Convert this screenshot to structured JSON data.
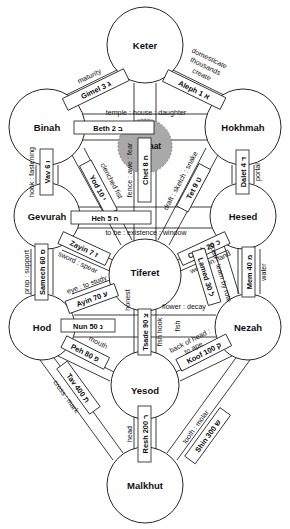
{
  "diagram": {
    "subtitle": "Sefirot and the 22 Hebrew letter paths",
    "colors": {
      "background": "#ffffff",
      "stroke": "#1a1a1a",
      "daat_fill": "#a9a9a9",
      "daat_stroke": "#6e6e6e",
      "text": "#111111"
    }
  },
  "sefirot": [
    {
      "id": "keter",
      "label": "Keter",
      "cx": 145,
      "cy": 45,
      "r": 38
    },
    {
      "id": "binah",
      "label": "Binah",
      "cx": 47,
      "cy": 127,
      "r": 38
    },
    {
      "id": "hokhmah",
      "label": "Hokhmah",
      "cx": 243,
      "cy": 127,
      "r": 38
    },
    {
      "id": "gevurah",
      "label": "Gevurah",
      "cx": 47,
      "cy": 216,
      "r": 33
    },
    {
      "id": "hesed",
      "label": "Hesed",
      "cx": 243,
      "cy": 216,
      "r": 33
    },
    {
      "id": "tiferet",
      "label": "Tiferet",
      "cx": 145,
      "cy": 275,
      "r": 36
    },
    {
      "id": "hod",
      "label": "Hod",
      "cx": 42,
      "cy": 327,
      "r": 33
    },
    {
      "id": "nezah",
      "label": "Nezah",
      "cx": 248,
      "cy": 327,
      "r": 33
    },
    {
      "id": "yesod",
      "label": "Yesod",
      "cx": 145,
      "cy": 385,
      "r": 34
    },
    {
      "id": "malkhut",
      "label": "Malkhut",
      "cx": 145,
      "cy": 485,
      "r": 38
    }
  ],
  "daat": {
    "id": "daat",
    "label": "Daat",
    "cx": 145,
    "cy": 146,
    "r": 27
  },
  "paths": [
    {
      "id": "aleph",
      "letter_name": "Aleph",
      "value": "1",
      "hebrew": "א",
      "letter_label": "Aleph 1  א",
      "meaning": "create : thousands : domesticate",
      "meaning_lines": [
        "create",
        "thousands",
        "domesticate"
      ],
      "from": "keter",
      "to": "hokhmah"
    },
    {
      "id": "beth",
      "letter_name": "Beth",
      "value": "2",
      "hebrew": "ב",
      "letter_label": "Beth 2  ב",
      "meaning": "temple : house : daughter",
      "meaning_lines": [
        "temple : house : daughter"
      ],
      "from": "binah",
      "to": "hokhmah"
    },
    {
      "id": "gimel",
      "letter_name": "Gimel",
      "value": "3",
      "hebrew": "ג",
      "letter_label": "Gimel 3    ג",
      "meaning": "maturity",
      "meaning_lines": [
        "maturity"
      ],
      "from": "binah",
      "to": "keter"
    },
    {
      "id": "dalet",
      "letter_name": "Dalet",
      "value": "4",
      "hebrew": "ד",
      "letter_label": "Dalet  4 ד",
      "meaning": "portal",
      "meaning_lines": [
        "portal"
      ],
      "from": "hokhmah",
      "to": "hesed"
    },
    {
      "id": "heh",
      "letter_name": "Heh",
      "value": "5",
      "hebrew": "ה",
      "letter_label": "Heh 5    ה",
      "meaning": "to be : existence : window",
      "meaning_lines": [
        "to be : existence : window"
      ],
      "from": "gevurah",
      "to": "hesed"
    },
    {
      "id": "vav",
      "letter_name": "Vav",
      "value": "6",
      "hebrew": "ו",
      "letter_label": "Vav 6 ו",
      "meaning": "hook : fastening",
      "meaning_lines": [
        "hook : fastening"
      ],
      "from": "binah",
      "to": "gevurah"
    },
    {
      "id": "zayin",
      "letter_name": "Zayin",
      "value": "7",
      "hebrew": "ז",
      "letter_label": "Zayin 7 ז",
      "meaning": "sword : spear",
      "meaning_lines": [
        "sword : spear"
      ],
      "from": "gevurah",
      "to": "tiferet"
    },
    {
      "id": "chet",
      "letter_name": "Chet",
      "value": "8",
      "hebrew": "ח",
      "letter_label": "Chet 8 ח",
      "meaning": "fence : awe : fear",
      "meaning_lines": [
        "fence : awe : fear"
      ],
      "from": "keter",
      "to": "tiferet"
    },
    {
      "id": "tet",
      "letter_name": "Tet",
      "value": "9",
      "hebrew": "ט",
      "letter_label": "Tet 9 ט",
      "meaning": "draft : sketch : snake",
      "meaning_lines": [
        "draft : sketch : snake"
      ],
      "from": "hokhmah",
      "to": "tiferet"
    },
    {
      "id": "yod",
      "letter_name": "Yod",
      "value": "10",
      "hebrew": "י",
      "letter_label": "Yod 10  י",
      "meaning": "clenched fist",
      "meaning_lines": [
        "clenched fist"
      ],
      "from": "binah",
      "to": "tiferet"
    },
    {
      "id": "caph",
      "letter_name": "Caph",
      "value": "20",
      "hebrew": "כ",
      "letter_label": "Caph 20 כ",
      "meaning": "weigh in hand",
      "meaning_lines": [
        "weigh in hand"
      ],
      "from": "hesed",
      "to": "tiferet"
    },
    {
      "id": "lamed",
      "letter_name": "Lamed",
      "value": "30",
      "hebrew": "ל",
      "letter_label": "Lamed 30 ל",
      "meaning": "goad : learn by rote",
      "meaning_lines": [
        "goad : learn by rote"
      ],
      "from": "hesed",
      "to": "nezah"
    },
    {
      "id": "mem",
      "letter_name": "Mem",
      "value": "40",
      "hebrew": "מ",
      "letter_label": "Mem 40 מ",
      "meaning": "water",
      "meaning_lines": [
        "water"
      ],
      "from": "hesed",
      "to": "nezah"
    },
    {
      "id": "nun",
      "letter_name": "Nun",
      "value": "50",
      "hebrew": "נ",
      "letter_label": "Nun 50  נ",
      "meaning": "fish",
      "meaning_lines": [
        "fish"
      ],
      "from": "hod",
      "to": "nezah"
    },
    {
      "id": "samech",
      "letter_name": "Samech",
      "value": "60",
      "hebrew": "ס",
      "letter_label": "Samech 60 ס",
      "meaning": "prop : support",
      "meaning_lines": [
        "prop : support"
      ],
      "from": "gevurah",
      "to": "hod"
    },
    {
      "id": "ayin",
      "letter_name": "Ayin",
      "value": "70",
      "hebrew": "ע",
      "letter_label": "Ayin 70 ע",
      "meaning": "eye : to study",
      "meaning_lines": [
        "eye : to study"
      ],
      "from": "hod",
      "to": "tiferet"
    },
    {
      "id": "peh",
      "letter_name": "Peh",
      "value": "80",
      "hebrew": "פ",
      "letter_label": "Peh 80 פ",
      "meaning": "mouth",
      "meaning_lines": [
        "mouth"
      ],
      "from": "hod",
      "to": "yesod"
    },
    {
      "id": "tsade",
      "letter_name": "Tsade",
      "value": "90",
      "hebrew": "צ",
      "letter_label": "Tsade 90 צ",
      "meaning": "fish hook",
      "meaning_lines": [
        "fish hook"
      ],
      "from": "tiferet",
      "to": "yesod"
    },
    {
      "id": "koof",
      "letter_name": "Koof",
      "value": "100",
      "hebrew": "ק",
      "letter_label": "Koof 100 ק",
      "meaning": "back of head : to ape",
      "meaning_lines": [
        "back of head :",
        "to ape"
      ],
      "from": "nezah",
      "to": "yesod"
    },
    {
      "id": "resh",
      "letter_name": "Resh",
      "value": "200",
      "hebrew": "ר",
      "letter_label": "Resh 200  ר",
      "meaning": "head",
      "meaning_lines": [
        "head"
      ],
      "from": "yesod",
      "to": "malkhut"
    },
    {
      "id": "shin",
      "letter_name": "Shin",
      "value": "300",
      "hebrew": "ש",
      "letter_label": "Shin 300  ש",
      "meaning": "tooth : molar",
      "meaning_lines": [
        "tooth : molar"
      ],
      "from": "nezah",
      "to": "malkhut"
    },
    {
      "id": "tav",
      "letter_name": "Tav",
      "value": "400",
      "hebrew": "ת",
      "letter_label": "Tav 400  ת",
      "meaning": "cross : mark",
      "meaning_lines": [
        "cross : mark"
      ],
      "from": "hod",
      "to": "malkhut"
    }
  ],
  "extra_labels": {
    "honest": "honest",
    "flower_decay": "flower : decay"
  }
}
